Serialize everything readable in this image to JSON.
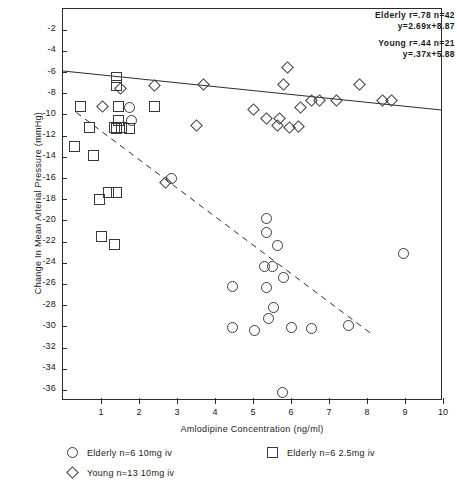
{
  "chart_data": {
    "type": "scatter",
    "title": "",
    "xlabel": "Amlodipine Concentration (ng/ml)",
    "ylabel": "Change In Mean Arterial Pressure (mmHg)",
    "xlim": [
      0,
      10
    ],
    "ylim": [
      0,
      -37
    ],
    "xticks": [
      1,
      2,
      3,
      4,
      5,
      6,
      7,
      8,
      9,
      10
    ],
    "xticklabels": [
      "1",
      "2",
      "3",
      "4",
      "5",
      "6",
      "7",
      "8",
      "9",
      "10"
    ],
    "yticks": [
      -2,
      -4,
      -6,
      -8,
      -10,
      -12,
      -14,
      -16,
      -18,
      -20,
      -22,
      -24,
      -26,
      -28,
      -30,
      -32,
      -34,
      -36
    ],
    "yticklabels": [
      "-2",
      "-4",
      "-6",
      "-8",
      "-10",
      "-12",
      "-14",
      "-16",
      "-18",
      "-20",
      "-22",
      "-24",
      "-26",
      "-28",
      "-30",
      "-32",
      "-34",
      "-36"
    ],
    "grid": false,
    "legend_position": "below-axes",
    "series": [
      {
        "name": "Elderly n=6 10mg iv",
        "marker": "circle",
        "points": [
          [
            5.78,
            -36.2
          ],
          [
            4.45,
            -30.1
          ],
          [
            5.05,
            -30.3
          ],
          [
            6.0,
            -30.1
          ],
          [
            6.55,
            -30.2
          ],
          [
            5.4,
            -29.2
          ],
          [
            5.55,
            -28.2
          ],
          [
            4.45,
            -26.2
          ],
          [
            5.35,
            -26.3
          ],
          [
            5.8,
            -25.3
          ],
          [
            5.3,
            -24.3
          ],
          [
            5.5,
            -24.3
          ],
          [
            7.5,
            -29.9
          ],
          [
            5.65,
            -22.3
          ],
          [
            5.35,
            -21.1
          ],
          [
            5.35,
            -19.8
          ],
          [
            2.85,
            -16.0
          ],
          [
            8.95,
            -23.1
          ],
          [
            1.8,
            -10.5
          ],
          [
            1.75,
            -9.3
          ]
        ]
      },
      {
        "name": "Elderly n=6 2.5mg iv",
        "marker": "square",
        "points": [
          [
            1.35,
            -22.2
          ],
          [
            1.0,
            -21.5
          ],
          [
            0.95,
            -18.0
          ],
          [
            1.2,
            -17.3
          ],
          [
            1.4,
            -17.3
          ],
          [
            0.8,
            -13.8
          ],
          [
            0.3,
            -13.0
          ],
          [
            0.7,
            -11.2
          ],
          [
            1.35,
            -11.2
          ],
          [
            1.55,
            -11.2
          ],
          [
            1.75,
            -11.3
          ],
          [
            1.4,
            -11.3
          ],
          [
            1.45,
            -10.5
          ],
          [
            0.45,
            -9.2
          ],
          [
            1.45,
            -9.2
          ],
          [
            2.4,
            -9.2
          ],
          [
            1.4,
            -7.2
          ],
          [
            1.4,
            -6.5
          ]
        ]
      },
      {
        "name": "Young n=13 10mg iv",
        "marker": "diamond",
        "points": [
          [
            2.7,
            -16.4
          ],
          [
            3.5,
            -11.0
          ],
          [
            5.65,
            -11.0
          ],
          [
            5.95,
            -11.2
          ],
          [
            6.2,
            -11.1
          ],
          [
            5.35,
            -10.3
          ],
          [
            5.7,
            -10.3
          ],
          [
            5.0,
            -9.5
          ],
          [
            6.25,
            -9.3
          ],
          [
            6.55,
            -8.6
          ],
          [
            6.75,
            -8.6
          ],
          [
            7.2,
            -8.6
          ],
          [
            8.4,
            -8.6
          ],
          [
            8.65,
            -8.6
          ],
          [
            1.05,
            -9.2
          ],
          [
            1.5,
            -7.5
          ],
          [
            2.4,
            -7.2
          ],
          [
            3.7,
            -7.1
          ],
          [
            5.8,
            -7.1
          ],
          [
            7.8,
            -7.1
          ],
          [
            5.9,
            -5.5
          ]
        ]
      }
    ],
    "fit_lines": [
      {
        "name": "Elderly",
        "style": "dashed",
        "slope": -2.69,
        "intercept": -8.87,
        "x_start": 0.35,
        "x_end": 8.2,
        "label_r": ".78",
        "label_n": "42"
      },
      {
        "name": "Young",
        "style": "solid",
        "slope": -0.37,
        "intercept": -5.88,
        "x_start": 0.0,
        "x_end": 10.0,
        "label_r": ".44",
        "label_n": "21"
      }
    ],
    "annotations": [
      {
        "id": "elderly",
        "line1": "Elderly r=.78 n=42",
        "line2": "y=2.69x+8.87"
      },
      {
        "id": "young",
        "line1": "Young r=.44 n=21",
        "line2": "y=.37x+5.88"
      }
    ],
    "legend": [
      {
        "marker": "circle",
        "label": "Elderly n=6 10mg iv"
      },
      {
        "marker": "square",
        "label": "Elderly n=6 2.5mg iv"
      },
      {
        "marker": "diamond",
        "label": "Young n=13 10mg iv"
      }
    ],
    "colors": {
      "ink": "#2b2b2b",
      "marker_stroke": "#3a3a3a",
      "background": "#ffffff"
    }
  }
}
